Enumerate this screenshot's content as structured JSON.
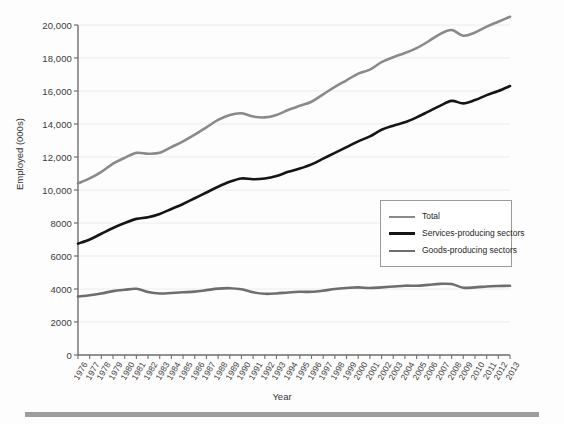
{
  "chart_data": {
    "type": "line",
    "title": "",
    "xlabel": "Year",
    "ylabel": "Employed (000s)",
    "xlim": [
      1976,
      2013
    ],
    "ylim": [
      0,
      20000
    ],
    "grid": true,
    "legend_position": "center-right",
    "ytick_labels": [
      "0",
      "2000",
      "4000",
      "6000",
      "8000",
      "10,000",
      "12,000",
      "14,000",
      "16,000",
      "18,000",
      "20,000"
    ],
    "ytick_values": [
      0,
      2000,
      4000,
      6000,
      8000,
      10000,
      12000,
      14000,
      16000,
      18000,
      20000
    ],
    "categories": [
      1976,
      1977,
      1978,
      1979,
      1980,
      1981,
      1982,
      1983,
      1984,
      1985,
      1986,
      1987,
      1988,
      1989,
      1990,
      1991,
      1992,
      1993,
      1994,
      1995,
      1996,
      1997,
      1998,
      1999,
      2000,
      2001,
      2002,
      2003,
      2004,
      2005,
      2006,
      2007,
      2008,
      2009,
      2010,
      2011,
      2012,
      2013
    ],
    "series": [
      {
        "name": "Total",
        "color": "#8a8a8a",
        "width": 2.6,
        "values": [
          10400,
          10700,
          11100,
          11600,
          11950,
          12250,
          12200,
          12250,
          12600,
          12950,
          13350,
          13800,
          14250,
          14550,
          14650,
          14450,
          14400,
          14550,
          14850,
          15100,
          15350,
          15800,
          16250,
          16650,
          17050,
          17300,
          17750,
          18050,
          18300,
          18600,
          19000,
          19450,
          19700,
          19350,
          19550,
          19900,
          20200,
          20500
        ]
      },
      {
        "name": "Services-producing sectors",
        "color": "#151515",
        "width": 2.6,
        "values": [
          6750,
          7000,
          7350,
          7700,
          8000,
          8250,
          8350,
          8550,
          8850,
          9150,
          9500,
          9850,
          10200,
          10500,
          10700,
          10650,
          10700,
          10850,
          11100,
          11300,
          11550,
          11900,
          12250,
          12600,
          12950,
          13250,
          13650,
          13900,
          14100,
          14400,
          14750,
          15100,
          15400,
          15250,
          15450,
          15750,
          16000,
          16300
        ]
      },
      {
        "name": "Goods-producing sectors",
        "color": "#6e6e6e",
        "width": 2.6,
        "values": [
          3550,
          3620,
          3730,
          3870,
          3950,
          4010,
          3820,
          3730,
          3760,
          3800,
          3840,
          3930,
          4020,
          4050,
          3980,
          3800,
          3710,
          3730,
          3790,
          3830,
          3830,
          3900,
          4000,
          4060,
          4100,
          4060,
          4100,
          4150,
          4200,
          4200,
          4250,
          4310,
          4300,
          4080,
          4100,
          4150,
          4180,
          4200
        ]
      }
    ]
  },
  "axes": {
    "x_title": "Year",
    "y_title": "Employed (000s)"
  },
  "legend": {
    "items": [
      {
        "label": "Total",
        "color": "#8a8a8a"
      },
      {
        "label": "Services-producing sectors",
        "color": "#151515"
      },
      {
        "label": "Goods-producing sectors",
        "color": "#6e6e6e"
      }
    ]
  }
}
